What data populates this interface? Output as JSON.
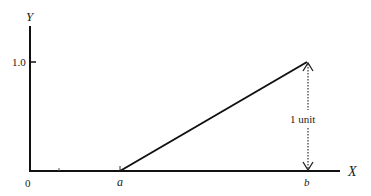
{
  "diagram": {
    "axes": {
      "x_label": "X",
      "y_label": "Y",
      "origin_label": "0",
      "y_tick_label": "1.0"
    },
    "points": {
      "a_label": "a",
      "b_label": "b"
    },
    "annotation": {
      "text": "1 unit"
    },
    "colors": {
      "line": "#111111",
      "text": "#222222"
    }
  }
}
